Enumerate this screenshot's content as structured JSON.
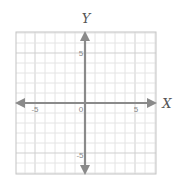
{
  "chart_data": {
    "type": "scatter",
    "title": "",
    "xlabel": "X",
    "ylabel": "Y",
    "xlim": [
      -7,
      7
    ],
    "ylim": [
      -7,
      7
    ],
    "grid": true,
    "grid_step": 1,
    "x_ticks": [
      -5,
      0,
      5
    ],
    "y_ticks": [
      -5,
      5
    ],
    "tick_labels": {
      "x_neg": "-5",
      "origin": "0",
      "x_pos": "5",
      "y_pos": "5",
      "y_neg": "-5"
    },
    "series": [],
    "axes_arrows": true
  },
  "labels": {
    "x_axis": "X",
    "y_axis": "Y",
    "origin": "0",
    "x_neg5": "-5",
    "x_pos5": "5",
    "y_pos5": "5",
    "y_neg5": "-5"
  },
  "colors": {
    "grid_minor": "#e4e4e4",
    "grid_major": "#cfcfcf",
    "border": "#bdbdbd",
    "axis": "#8a8a8a",
    "label": "#555555"
  }
}
